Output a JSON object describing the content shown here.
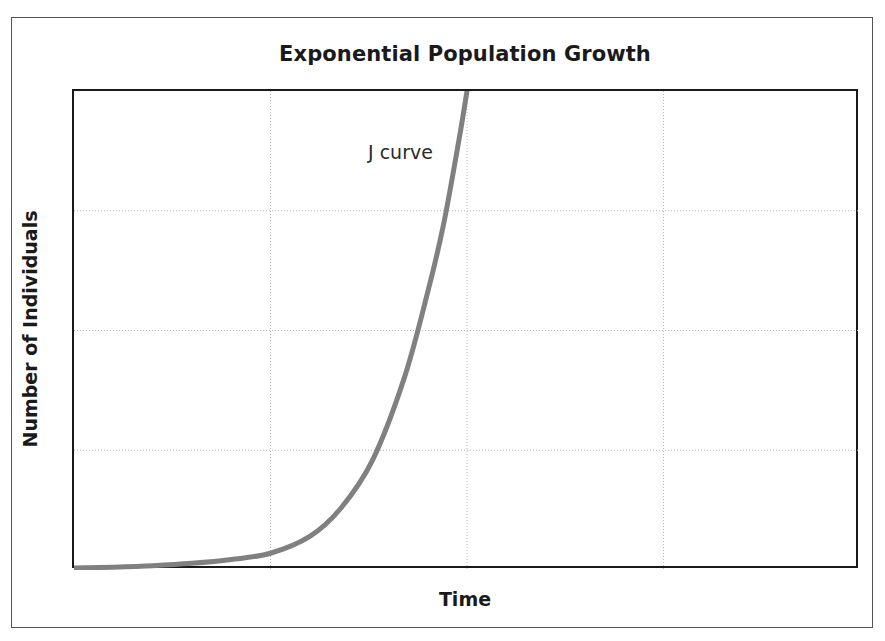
{
  "chart_data": {
    "type": "line",
    "title": "Exponential Population Growth",
    "xlabel": "Time",
    "ylabel": "Number of Individuals",
    "annotations": [
      {
        "text": "J curve",
        "x": 0.5,
        "y": 0.88
      }
    ],
    "legend": null,
    "legend_position": "none",
    "grid": true,
    "grid_style": "dotted",
    "grid_color": "#b8b8b8",
    "xlim": [
      0,
      1
    ],
    "ylim": [
      0,
      1
    ],
    "x_ticks": [
      0.0,
      0.25,
      0.5,
      0.75,
      1.0
    ],
    "y_ticks": [
      0.0,
      0.25,
      0.5,
      0.75,
      1.0
    ],
    "x_tick_labels": [
      "",
      "",
      "",
      "",
      ""
    ],
    "y_tick_labels": [
      "",
      "",
      "",
      "",
      ""
    ],
    "series": [
      {
        "name": "J curve",
        "color": "#808080",
        "line_width": 5,
        "x": [
          0.0,
          0.05,
          0.1,
          0.15,
          0.2,
          0.25,
          0.3,
          0.34,
          0.38,
          0.42,
          0.45,
          0.47,
          0.49,
          0.5
        ],
        "y": [
          0.004,
          0.006,
          0.009,
          0.014,
          0.022,
          0.035,
          0.07,
          0.13,
          0.23,
          0.4,
          0.58,
          0.72,
          0.9,
          1.0
        ]
      }
    ],
    "colors": {
      "curve": "#808080",
      "axis": "#1a1a1a",
      "grid": "#b8b8b8",
      "background": "#ffffff",
      "outer_border": "#555555",
      "text": "#1a1a1a"
    }
  }
}
